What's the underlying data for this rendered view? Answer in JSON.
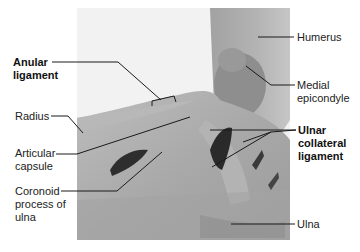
{
  "figure": {
    "labels": {
      "anular_ligament": "Anular\nligament",
      "radius": "Radius",
      "articular_capsule": "Articular\ncapsule",
      "coronoid_process": "Coronoid\nprocess of\nulna",
      "humerus": "Humerus",
      "medial_epicondyle": "Medial\nepicondyle",
      "ulnar_collateral_ligament": "Ulnar\ncollateral\nligament",
      "ulna": "Ulna"
    },
    "colors": {
      "background": "#ffffff",
      "photo_bg": "#f1f1f1",
      "tissue_light": "#c9c9c9",
      "tissue_mid": "#a6a6a6",
      "tissue_dark": "#6a6a6a",
      "cavity": "#2a2a2a",
      "leader_line": "#1a1a1a"
    }
  }
}
